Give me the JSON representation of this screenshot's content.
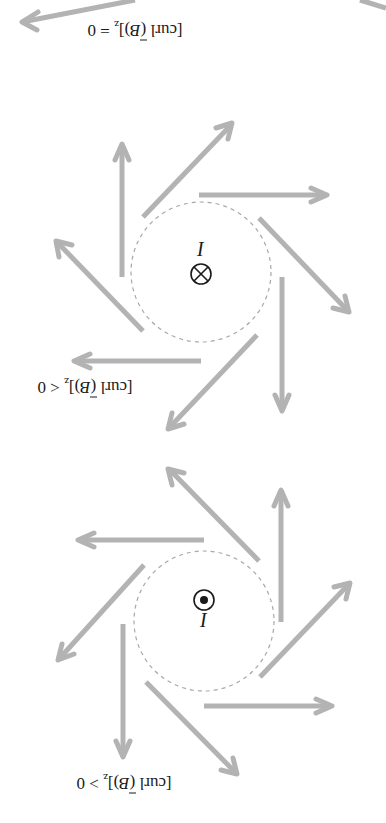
{
  "figure": {
    "orientation": "rotated 180 degrees",
    "background": "#ffffff",
    "arrow_color": "#b3b3b3",
    "circle_color": "#a8a8a8",
    "text_color": "#1a1a1a"
  },
  "panels": [
    {
      "id": "curl-zero",
      "condition": "[curl (B)]z = 0",
      "label_parts": {
        "prefix": "[curl (",
        "vector": "B",
        "suffix": ")]",
        "sub": "z",
        "relation": " = 0"
      },
      "partially_visible": true
    },
    {
      "id": "curl-negative",
      "condition": "[curl (B)]z < 0",
      "label_parts": {
        "prefix": "[curl (",
        "vector": "B",
        "suffix": ")]",
        "sub": "z",
        "relation": " < 0"
      },
      "current_label": "I",
      "current_symbol": "⊗",
      "current_direction": "into page"
    },
    {
      "id": "curl-positive",
      "condition": "[curl (B)]z > 0",
      "label_parts": {
        "prefix": "[curl (",
        "vector": "B",
        "suffix": ")]",
        "sub": "z",
        "relation": " > 0"
      },
      "current_label": "I",
      "current_symbol": "⊙",
      "current_direction": "out of page"
    }
  ]
}
